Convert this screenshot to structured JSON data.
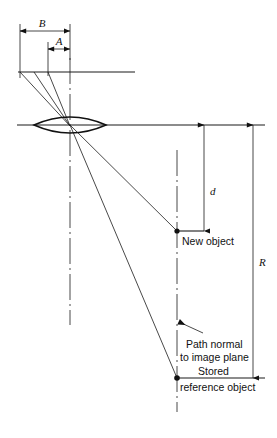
{
  "figure": {
    "type": "optical-ray-diagram",
    "title": "",
    "background_color": "#ffffff",
    "line_color": "#1a1a1a"
  },
  "dimensions": {
    "B": {
      "label": "B",
      "orientation": "horizontal",
      "y": 31,
      "x_start": 20,
      "x_end": 70,
      "label_x": 44,
      "label_y": 27
    },
    "A": {
      "label": "A",
      "orientation": "horizontal",
      "y": 49,
      "x_start": 48,
      "x_end": 70,
      "label_x": 60,
      "label_y": 45
    },
    "d": {
      "label": "d",
      "orientation": "vertical",
      "x": 204,
      "y_start": 125,
      "y_end": 231,
      "label_x": 209,
      "label_y": 192
    },
    "R": {
      "label": "R",
      "orientation": "vertical",
      "x": 253,
      "y_start": 125,
      "y_end": 378,
      "label_x": 259,
      "label_y": 262
    }
  },
  "labels": {
    "new_object": "New object",
    "path_normal_line1": "Path normal",
    "path_normal_line2": "to image plane",
    "stored": "Stored",
    "reference_object": "reference object"
  },
  "elements": {
    "lens": {
      "name": "biconvex lens",
      "center_x": 70,
      "center_y": 125,
      "half_width": 36,
      "half_height": 9
    },
    "optical_axis": {
      "y": 125,
      "x_start": 17,
      "x_end": 265
    },
    "object_plane": {
      "y": 72,
      "x_start": 18,
      "x_end": 135
    },
    "image_plane_bottom": {
      "y": 378,
      "x_start": 177,
      "x_end": 265
    },
    "new_object_point": {
      "x": 177,
      "y": 231
    },
    "reference_object_point": {
      "x": 177,
      "y": 378
    },
    "centerline_lens": {
      "x": 70,
      "y_start": 58,
      "y_end": 325
    },
    "centerline_objects": {
      "x": 177,
      "y_start": 150,
      "y_end": 410
    }
  },
  "rays": [
    {
      "name": "ray-upper-left",
      "x1": 20,
      "y1": 72,
      "x2": 70,
      "y2": 125
    },
    {
      "name": "ray-mid",
      "x1": 48,
      "y1": 72,
      "x2": 70,
      "y2": 125
    },
    {
      "name": "ray-to-new-object",
      "x1": 70,
      "y1": 125,
      "x2": 177,
      "y2": 231
    },
    {
      "name": "ray-to-reference-object",
      "x1": 70,
      "y1": 125,
      "x2": 177,
      "y2": 378
    }
  ],
  "leader": {
    "name": "path-normal-leader",
    "tip_x": 177,
    "tip_y": 322,
    "tail_x": 204,
    "tail_y": 334
  }
}
